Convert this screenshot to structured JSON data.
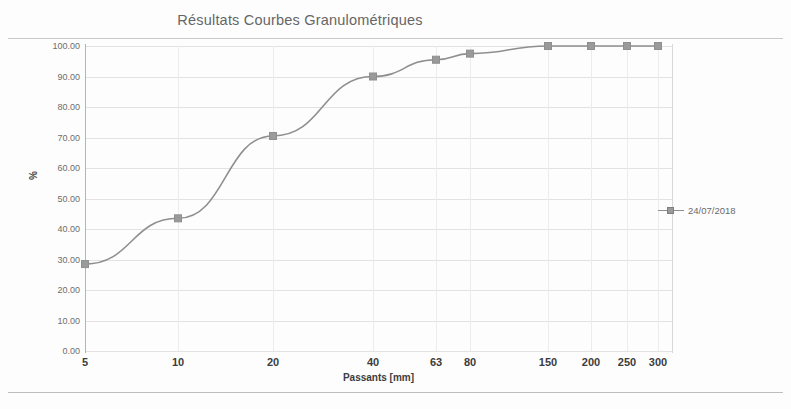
{
  "chart_data": {
    "type": "line",
    "title": "Résultats Courbes Granulométriques",
    "xlabel": "Passants [mm]",
    "ylabel": "%",
    "categories": [
      "5",
      "10",
      "20",
      "40",
      "63",
      "80",
      "150",
      "200",
      "250",
      "300"
    ],
    "series": [
      {
        "name": "24/07/2018",
        "values": [
          28.5,
          43.5,
          70.5,
          90.0,
          95.5,
          97.5,
          100.0,
          100.0,
          100.0,
          100.0
        ]
      }
    ],
    "ylim": [
      0,
      100
    ],
    "ytick_labels": [
      "100.00",
      "90.00",
      "80.00",
      "70.00",
      "60.00",
      "50.00",
      "40.00",
      "30.00",
      "20.00",
      "10.00",
      "0.00"
    ],
    "ytick_values": [
      100,
      90,
      80,
      70,
      60,
      50,
      40,
      30,
      20,
      10,
      0
    ],
    "grid": true,
    "legend_position": "right",
    "marker": "square",
    "colors": {
      "series_line": "#8f8f8f",
      "series_marker": "#9a9a9a",
      "grid": "#e2e2e2",
      "axis": "#b4b4b4",
      "title_text": "#666666",
      "tick_text": "#3c3c3c"
    }
  },
  "legend": {
    "entries": [
      {
        "label": "24/07/2018"
      }
    ]
  },
  "x_positions": [
    85,
    178,
    273,
    373,
    436,
    470,
    548,
    591,
    627,
    658
  ]
}
